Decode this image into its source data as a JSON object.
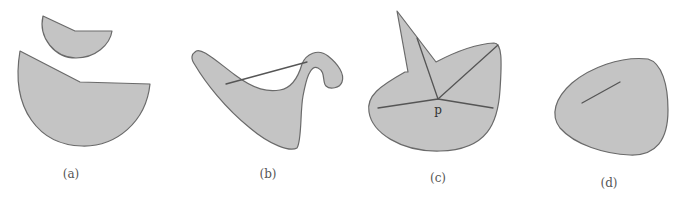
{
  "figure": {
    "panels": [
      {
        "id": "a",
        "label": "(a)",
        "description": "Two disjoint shapes (not connected)"
      },
      {
        "id": "b",
        "label": "(b)",
        "description": "Non-convex shape with segment leaving the region"
      },
      {
        "id": "c",
        "label": "(c)",
        "description": "Star-shaped region with respect to point p",
        "point_label": "p"
      },
      {
        "id": "d",
        "label": "(d)",
        "description": "Convex region with a segment inside"
      }
    ],
    "colors": {
      "fill": "#c4c4c4",
      "stroke": "#6a6a6a",
      "segment": "#555555",
      "label": "#555555"
    }
  }
}
